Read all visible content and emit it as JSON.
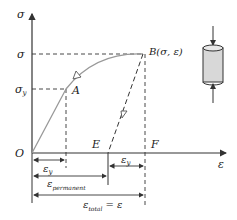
{
  "diagram": {
    "type": "stress-strain",
    "axes": {
      "y_label": "σ",
      "x_label": "ε",
      "origin_label": "O"
    },
    "levels": {
      "sigma": "σ",
      "sigma_y_base": "σ",
      "sigma_y_sub": "y"
    },
    "points": {
      "A": "A",
      "B": "B(σ, ε)",
      "E": "E",
      "F": "F"
    },
    "dimensions": {
      "eps_y_left": {
        "base": "ε",
        "sub": "y"
      },
      "eps_y_right": {
        "base": "ε",
        "sub": "y"
      },
      "eps_permanent": {
        "base": "ε",
        "sub": "permanent"
      },
      "eps_total": {
        "base": "ε",
        "sub": "total",
        "suffix": " = ε"
      }
    },
    "specimen": {
      "label": "compressed-cylinder"
    },
    "colors": {
      "curve": "#999999",
      "line": "#333333",
      "fill": "#d8d8d8"
    }
  }
}
